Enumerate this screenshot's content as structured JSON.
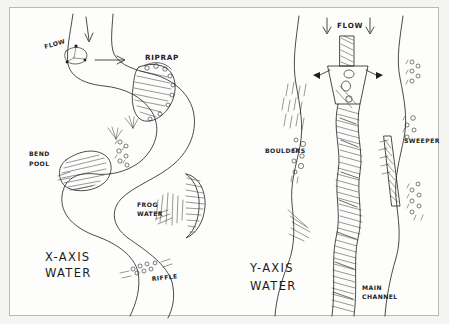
{
  "document": {
    "title": "Hand-drawn river feature sketch",
    "medium": "pen on paper",
    "ink_color": "#1d1d1d",
    "paper_color": "#fdfdfc",
    "border_color": "#b9b9b7"
  },
  "panels": [
    {
      "id": "plan-view",
      "caption_line1": "X-AXIS",
      "caption_line2": "WATER",
      "description": "meandering stream plan view"
    },
    {
      "id": "section-view",
      "caption_line1": "Y-AXIS",
      "caption_line2": "WATER",
      "description": "downstream cross-channel view"
    }
  ],
  "labels": {
    "flow_left": "FLOW",
    "flow_right": "FLOW",
    "riprap": "RIPRAP",
    "bend_pool_line1": "BEND",
    "bend_pool_line2": "POOL",
    "frog_water_line1": "FROG",
    "frog_water_line2": "WATER",
    "riffle": "RIFFLE",
    "boulders": "BOULDERS",
    "sweeper": "SWEEPER",
    "main_channel_line1": "MAIN",
    "main_channel_line2": "CHANNEL",
    "x_axis_line1": "X-AXIS",
    "x_axis_line2": "WATER",
    "y_axis_line1": "Y-AXIS",
    "y_axis_line2": "WATER"
  },
  "features": [
    {
      "name": "riprap",
      "label": "RIPRAP",
      "panel": "plan-view",
      "rendering": "hatched armored bank"
    },
    {
      "name": "bend-pool",
      "label": "BEND POOL",
      "panel": "plan-view",
      "rendering": "hatched scour pool at outside bend"
    },
    {
      "name": "frog-water",
      "label": "FROG WATER",
      "panel": "plan-view",
      "rendering": "slack shallow water with grass strokes"
    },
    {
      "name": "riffle",
      "label": "RIFFLE",
      "panel": "plan-view",
      "rendering": "cobble dots across channel"
    },
    {
      "name": "boulders",
      "label": "BOULDERS",
      "panel": "section-view",
      "rendering": "scattered circles along margin"
    },
    {
      "name": "sweeper",
      "label": "SWEEPER",
      "panel": "section-view",
      "rendering": "hatched overhanging tree"
    },
    {
      "name": "main-channel",
      "label": "MAIN CHANNEL",
      "panel": "section-view",
      "rendering": "dense hatched sinuous band"
    }
  ]
}
